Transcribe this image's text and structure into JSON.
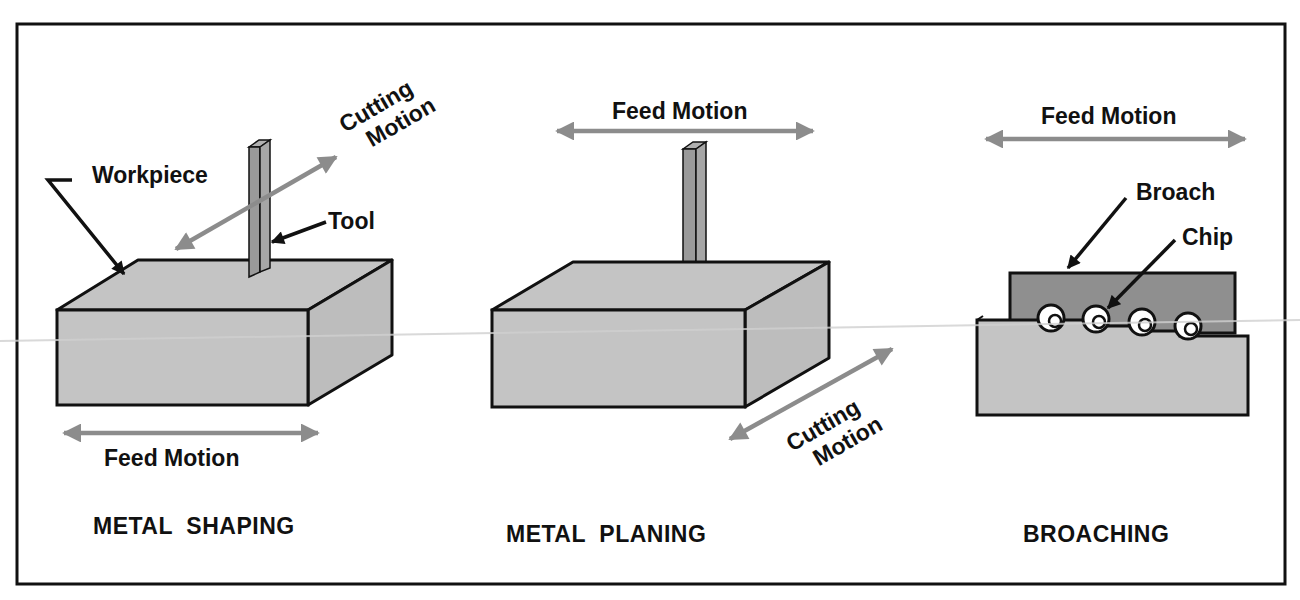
{
  "colors": {
    "frame": "#111111",
    "block_fill": "#c4c4c4",
    "block_side": "#bdbdbd",
    "tool_fill": "#9a9a9a",
    "broach_fill": "#8f8f8f",
    "arrow_gray": "#8c8c8c",
    "leader_black": "#111111",
    "chip_fill": "#ffffff",
    "scanline": "#d0d0d0"
  },
  "panels": [
    {
      "id": "shaping",
      "title": "METAL  SHAPING",
      "labels": {
        "workpiece": "Workpiece",
        "tool": "Tool",
        "cutting_line1": "Cutting",
        "cutting_line2": "Motion",
        "feed": "Feed Motion"
      }
    },
    {
      "id": "planing",
      "title": "METAL  PLANING",
      "labels": {
        "feed": "Feed Motion",
        "cutting_line1": "Cutting",
        "cutting_line2": "Motion"
      }
    },
    {
      "id": "broaching",
      "title": "BROACHING",
      "labels": {
        "feed": "Feed Motion",
        "broach": "Broach",
        "chip": "Chip"
      }
    }
  ]
}
